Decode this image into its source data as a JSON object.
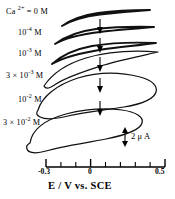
{
  "figure": {
    "type": "cyclic-voltammogram",
    "background_color": "#ffffff",
    "line_color": "#111111"
  },
  "chart_data": {
    "type": "line",
    "title": "",
    "subtitle": "",
    "xlabel": "E / V vs. SCE",
    "ylabel": "",
    "xlim": [
      -0.3,
      0.5
    ],
    "ylim": [
      null,
      null
    ],
    "grid": false,
    "legend_position": "inline-left-labels",
    "x_ticks_major": [
      -0.3,
      0.0,
      0.5
    ],
    "x_tick_labels_major": [
      "-0.3",
      "0",
      "0.5"
    ],
    "x_ticks_minor": [
      -0.2,
      -0.1,
      0.1,
      0.2,
      0.3,
      0.4
    ],
    "scalebar": {
      "value": "2",
      "unit": "μ A",
      "text": "2 μ A",
      "orientation": "vertical",
      "double_headed": true
    },
    "annotation_arrows": {
      "count": 5,
      "direction": "down",
      "meaning": "increasing Ca2+ concentration"
    },
    "series": [
      {
        "name": "Ca2+ = 0 M",
        "label_html": "Ca <sup>2+</sup> = 0 M",
        "concentration": "0 M",
        "peak_separation": "none-featureless",
        "description": "nearly flat sloping trace, no redox peaks"
      },
      {
        "name": "1e-4 M",
        "label_html": "10<sup>-4</sup> M",
        "concentration": "10^-4 M",
        "peak_separation": "none-featureless",
        "description": "nearly flat sloping trace, no redox peaks"
      },
      {
        "name": "1e-3 M",
        "label_html": "10<sup>-3</sup> M",
        "concentration": "10^-3 M",
        "peak_separation": "small",
        "description": "slightly opened loop, faint peaks emerging"
      },
      {
        "name": "3e-3 M",
        "label_html": "3 × 10<sup>-3</sup> M",
        "concentration": "3 x 10^-3 M",
        "peak_separation": "moderate",
        "description": "open loop, discernible anodic and cathodic waves"
      },
      {
        "name": "1e-2 M",
        "label_html": "10<sup>-2</sup> M",
        "concentration": "10^-2 M",
        "peak_separation": "large",
        "description": "wide loop with well developed redox peaks"
      },
      {
        "name": "3e-2 M",
        "label_html": "3 × 10<sup>-2</sup> M",
        "concentration": "3 x 10^-2 M",
        "peak_separation": "largest",
        "description": "largest loop, broad sigmoidal anodic and cathodic branches"
      }
    ]
  },
  "axis": {
    "title": "E / V vs. SCE",
    "tick_labels": [
      {
        "text": "-0.3",
        "value": -0.3
      },
      {
        "text": "0",
        "value": 0.0
      },
      {
        "text": "0.5",
        "value": 0.5
      }
    ]
  },
  "scalebar": {
    "text": "2 μ A"
  }
}
